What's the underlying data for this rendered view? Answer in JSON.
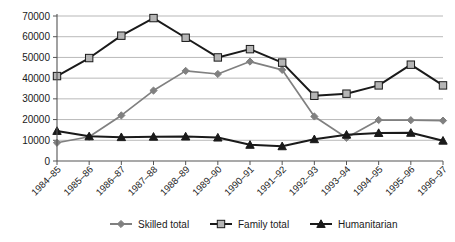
{
  "chart_data": {
    "type": "line",
    "title": "",
    "xlabel": "",
    "ylabel": "",
    "ylim": [
      0,
      70000
    ],
    "ytick_step": 10000,
    "yticks": [
      "0",
      "10000",
      "20000",
      "30000",
      "40000",
      "50000",
      "60000",
      "70000"
    ],
    "grid": true,
    "legend_position": "bottom",
    "categories": [
      "1984–85",
      "1985–86",
      "1986–87",
      "1987–88",
      "1988–89",
      "1989–90",
      "1990–91",
      "1991–92",
      "1992–93",
      "1993–94",
      "1994–95",
      "1995–96",
      "1996–97"
    ],
    "series": [
      {
        "name": "Skilled total",
        "marker": "diamond",
        "color": "#808080",
        "values": [
          8800,
          11700,
          22000,
          34000,
          43500,
          42000,
          48000,
          44000,
          21500,
          11200,
          19800,
          19700,
          19500
        ]
      },
      {
        "name": "Family total",
        "marker": "square",
        "color": "#b5b5b5",
        "line_color": "#1a1a1a",
        "values": [
          41000,
          49700,
          60500,
          69000,
          59500,
          50000,
          54000,
          47500,
          31500,
          32500,
          36500,
          46500,
          36500
        ]
      },
      {
        "name": "Humanitarian",
        "marker": "triangle",
        "color": "#1a1a1a",
        "values": [
          14500,
          11900,
          11500,
          11700,
          11800,
          11300,
          7800,
          7100,
          10500,
          12700,
          13500,
          13600,
          9800
        ]
      }
    ]
  },
  "legend": {
    "items": [
      {
        "label": "Skilled total"
      },
      {
        "label": "Family total"
      },
      {
        "label": "Humanitarian"
      }
    ]
  },
  "colors": {
    "skilled": "#808080",
    "family_fill": "#b5b5b5",
    "family_line": "#1a1a1a",
    "humanitarian": "#1a1a1a",
    "gridline": "#9a9a9a",
    "axis": "#555555",
    "background": "#ffffff"
  }
}
